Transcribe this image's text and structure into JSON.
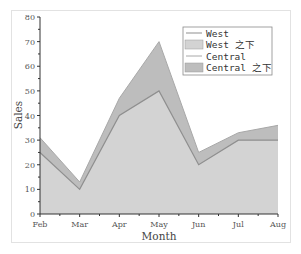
{
  "chart_data": {
    "type": "area",
    "stacked": true,
    "title": "",
    "xlabel": "Month",
    "ylabel": "Sales",
    "categories": [
      "Feb",
      "Mar",
      "Apr",
      "May",
      "Jun",
      "Jul",
      "Aug"
    ],
    "series": [
      {
        "name": "West",
        "values": [
          25,
          10,
          40,
          50,
          20,
          30,
          30
        ]
      },
      {
        "name": "Central",
        "values": [
          6,
          3,
          7,
          20,
          5,
          3,
          6
        ]
      }
    ],
    "stacked_totals": [
      31,
      13,
      47,
      70,
      25,
      33,
      36
    ],
    "ylim": [
      0,
      80
    ],
    "yticks": [
      0,
      10,
      20,
      30,
      40,
      50,
      60,
      70,
      80
    ],
    "grid": false,
    "legend_position": "upper-right",
    "legend": [
      {
        "label": "West",
        "kind": "line"
      },
      {
        "label": "West 之下",
        "kind": "fill"
      },
      {
        "label": "Central",
        "kind": "line"
      },
      {
        "label": "Central 之下",
        "kind": "fill"
      }
    ],
    "colors": {
      "west_fill": "#d3d3d3",
      "west_line": "#8f8f8f",
      "central_fill": "#bdbdbd",
      "central_line": "#a8a8a8",
      "axis": "#333333"
    }
  }
}
